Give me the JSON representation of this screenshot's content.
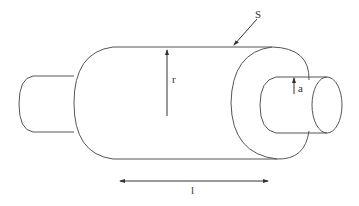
{
  "diagram": {
    "type": "cylinder-geometry",
    "stroke_color": "#555555",
    "labels": {
      "surface": "S",
      "outer_radius": "r",
      "inner_radius": "a",
      "length": "l"
    }
  }
}
